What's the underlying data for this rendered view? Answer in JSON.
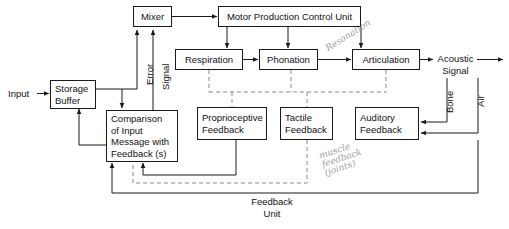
{
  "diagram": {
    "title_hidden": "Speech production and feedback block diagram",
    "nodes": {
      "mixer": "Mixer",
      "motor_control": "Motor Production Control Unit",
      "respiration": "Respiration",
      "phonation": "Phonation",
      "articulation": "Articulation",
      "storage_buffer": "Storage\nBuffer",
      "comparison": "Comparison\nof Input\nMessage with\nFeedback (s)",
      "proprioceptive": "Proprioceptive\nFeedback",
      "tactile": "Tactile\nFeedback",
      "auditory": "Auditory\nFeedback"
    },
    "labels": {
      "input": "Input",
      "acoustic_signal": "Acoustic\nSignal",
      "error": "Error",
      "signal": "Signal",
      "bone": "Bone",
      "air": "Air",
      "feedback_unit": "Feedback\nUnit"
    },
    "annotations": {
      "resonation": "Resonation",
      "muscle_feedback": "muscle\nfeedback\n(joints)"
    },
    "colors": {
      "stroke": "#1a1a1a",
      "dashed": "#8a8a8a",
      "text": "#111111",
      "handwriting": "#8e8e8e",
      "background": "#ffffff"
    }
  }
}
